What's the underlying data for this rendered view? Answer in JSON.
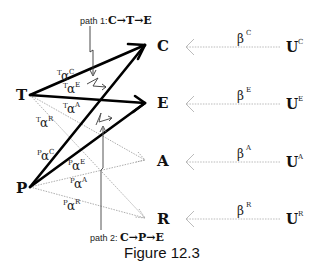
{
  "figure": {
    "caption": "Figure 12.3",
    "path1": {
      "label": "path 1:",
      "expr": "C→T→E"
    },
    "path2": {
      "label": "path 2:",
      "expr": "C→P→E"
    },
    "sources": [
      {
        "id": "T",
        "label": "T"
      },
      {
        "id": "P",
        "label": "P"
      }
    ],
    "targets": [
      {
        "id": "C",
        "label": "C",
        "beta": "β",
        "beta_sup": "C",
        "u": "U",
        "u_sup": "C"
      },
      {
        "id": "E",
        "label": "E",
        "beta": "β",
        "beta_sup": "E",
        "u": "U",
        "u_sup": "E"
      },
      {
        "id": "A",
        "label": "A",
        "beta": "β",
        "beta_sup": "A",
        "u": "U",
        "u_sup": "A"
      },
      {
        "id": "R",
        "label": "R",
        "beta": "β",
        "beta_sup": "R",
        "u": "U",
        "u_sup": "R"
      }
    ],
    "edges": [
      {
        "from": "T",
        "to": "C",
        "pre": "T",
        "sym": "α",
        "sup": "C",
        "style": "bold"
      },
      {
        "from": "T",
        "to": "E",
        "pre": "T",
        "sym": "α",
        "sup": "E",
        "style": "bold"
      },
      {
        "from": "T",
        "to": "A",
        "pre": "T",
        "sym": "α",
        "sup": "A",
        "style": "dotted"
      },
      {
        "from": "T",
        "to": "R",
        "pre": "T",
        "sym": "α",
        "sup": "R",
        "style": "dotted"
      },
      {
        "from": "P",
        "to": "C",
        "pre": "P",
        "sym": "α",
        "sup": "C",
        "style": "bold"
      },
      {
        "from": "P",
        "to": "E",
        "pre": "P",
        "sym": "α",
        "sup": "E",
        "style": "bold"
      },
      {
        "from": "P",
        "to": "A",
        "pre": "P",
        "sym": "α",
        "sup": "A",
        "style": "dotted"
      },
      {
        "from": "P",
        "to": "R",
        "pre": "P",
        "sym": "α",
        "sup": "R",
        "style": "dotted"
      }
    ]
  }
}
